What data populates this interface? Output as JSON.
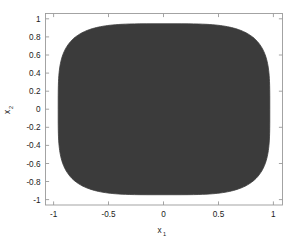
{
  "chart_data": {
    "type": "area",
    "title": "",
    "subtitle": "",
    "xlabel": "x",
    "xlabel_sub": "1",
    "ylabel": "x",
    "ylabel_sub": "2",
    "xlim": [
      -1.12,
      1.12
    ],
    "ylim": [
      -1.12,
      1.12
    ],
    "grid": false,
    "legend": null,
    "xticks": [
      -1,
      -0.5,
      0,
      0.5,
      1
    ],
    "xticklabels": [
      "-1",
      "-0.5",
      "0",
      "0.5",
      "1"
    ],
    "yticks": [
      1,
      0.8,
      0.6,
      0.4,
      0.2,
      0,
      -0.2,
      -0.4,
      -0.6,
      -0.8,
      -1
    ],
    "yticklabels": [
      "1",
      "0.8",
      "0.6",
      "0.4",
      "0.2",
      "0",
      "-0.2",
      "-0.4",
      "-0.6",
      "-0.8",
      "-1"
    ],
    "region": {
      "name": "feasible-region",
      "shape": "superellipse",
      "description": "Filled dark grey rounded-square (superellipse) region centred at origin",
      "center": [
        0,
        0
      ],
      "radius_x": 1.0,
      "radius_y": 1.0,
      "exponent": 4.0,
      "fill_color": "#3b3b3b",
      "edge_color": "#3b3b3b"
    },
    "background_color": "#ffffff",
    "frame_color": "#9a9a9a",
    "text_color": "#1a1a1a"
  }
}
